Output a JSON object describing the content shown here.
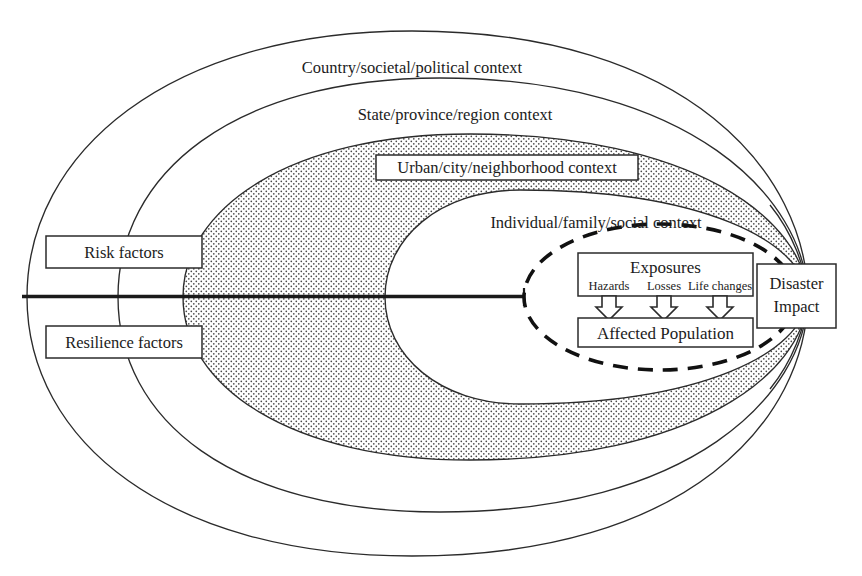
{
  "figure": {
    "background_color": "#ffffff",
    "line_color": "#2b2b2b",
    "text_color": "#1c1c1c"
  },
  "rings": [
    {
      "id": "country",
      "label": "Country/societal/political context",
      "fill": "none",
      "boxed": false
    },
    {
      "id": "state",
      "label": "State/province/region context",
      "fill": "none",
      "boxed": false
    },
    {
      "id": "urban",
      "label": "Urban/city/neighborhood context",
      "fill": "dotted",
      "boxed": true
    },
    {
      "id": "individual",
      "label": "Individual/family/social context",
      "fill": "white",
      "boxed": false
    }
  ],
  "side_boxes": [
    {
      "id": "risk",
      "label": "Risk factors"
    },
    {
      "id": "resilience",
      "label": "Resilience factors"
    }
  ],
  "core": {
    "dashed_ring_id": "exposure-boundary",
    "exposures": {
      "title": "Exposures",
      "items": [
        "Hazards",
        "Losses",
        "Life changes"
      ]
    },
    "affected_population": "Affected Population",
    "arrow_count": 3
  },
  "outcome": {
    "line1": "Disaster",
    "line2": "Impact"
  }
}
